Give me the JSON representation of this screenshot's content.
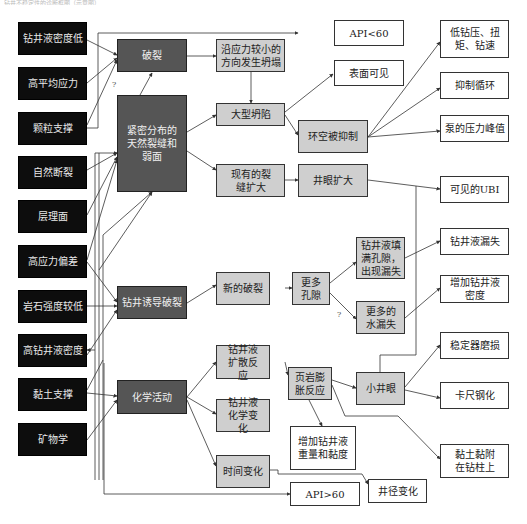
{
  "caption": "钻井不稳定性的诊断框图（示意图）",
  "causes": [
    {
      "id": "c1",
      "label": "钻井液密度低"
    },
    {
      "id": "c2",
      "label": "高平均应力"
    },
    {
      "id": "c3",
      "label": "颗粒支撑"
    },
    {
      "id": "c4",
      "label": "自然断裂"
    },
    {
      "id": "c5",
      "label": "层理面"
    },
    {
      "id": "c6",
      "label": "高应力偏差"
    },
    {
      "id": "c7",
      "label": "岩石强度较低"
    },
    {
      "id": "c8",
      "label": "高钻井液密度"
    },
    {
      "id": "c9",
      "label": "黏土支撑"
    },
    {
      "id": "c10",
      "label": "矿物学"
    }
  ],
  "mechanisms": [
    {
      "id": "m1",
      "label": "破裂"
    },
    {
      "id": "m2",
      "label": "紧密分布的天然裂缝和弱面"
    },
    {
      "id": "m3",
      "label": "钻井诱导破裂"
    },
    {
      "id": "m4",
      "label": "化学活动"
    }
  ],
  "processes": [
    {
      "id": "p1",
      "label": "沿应力较小的方向发生坍塌"
    },
    {
      "id": "p2",
      "label": "大型坍陷"
    },
    {
      "id": "p3",
      "label": "现有的裂缝扩大"
    },
    {
      "id": "p4",
      "label": "新的破裂"
    },
    {
      "id": "p5",
      "label": "钻井液扩散反应"
    },
    {
      "id": "p6",
      "label": "钻井液化学变化"
    },
    {
      "id": "p7",
      "label": "时间变化"
    },
    {
      "id": "p8",
      "label": "环空被抑制"
    },
    {
      "id": "p9",
      "label": "井眼扩大"
    },
    {
      "id": "p10",
      "label": "更多孔隙"
    },
    {
      "id": "p11",
      "label": "钻井液填满孔隙，出现漏失"
    },
    {
      "id": "p12",
      "label": "更多的水漏失"
    },
    {
      "id": "p13",
      "label": "页岩膨胀反应"
    },
    {
      "id": "p14",
      "label": "小井眼"
    }
  ],
  "indicators": [
    {
      "id": "i1",
      "label": "API<60"
    },
    {
      "id": "i2",
      "label": "表面可见"
    },
    {
      "id": "i3",
      "label": "低钻压、扭矩、钻速"
    },
    {
      "id": "i4",
      "label": "抑制循环"
    },
    {
      "id": "i5",
      "label": "泵的压力峰值"
    },
    {
      "id": "i6",
      "label": "可见的UBI"
    },
    {
      "id": "i7",
      "label": "钻井液漏失"
    },
    {
      "id": "i8",
      "label": "增加钻井液密度"
    },
    {
      "id": "i9",
      "label": "稳定器磨损"
    },
    {
      "id": "i10",
      "label": "卡尺钢化"
    },
    {
      "id": "i11",
      "label": "黏土黏附在钻柱上"
    },
    {
      "id": "i12",
      "label": "增加钻井液重量和黏度"
    },
    {
      "id": "i13",
      "label": "井径变化"
    },
    {
      "id": "i14",
      "label": "API>60"
    }
  ],
  "uncertain_marks": [
    "?",
    "?"
  ],
  "colors": {
    "cause_fill": "#0d0d0d",
    "mechanism_fill": "#555555",
    "process_fill": "#cfcfcf",
    "indicator_fill": "#ffffff",
    "line": "#333333"
  }
}
